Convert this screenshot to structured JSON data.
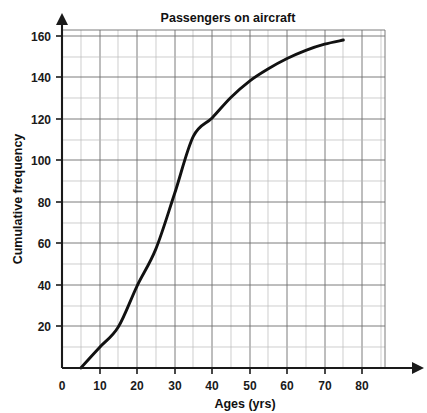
{
  "chart_data": {
    "type": "line",
    "title": "Passengers on aircraft",
    "xlabel": "Ages (yrs)",
    "ylabel": "Cumulative frequency",
    "xlim": [
      0,
      85
    ],
    "ylim": [
      0,
      170
    ],
    "grid": "on",
    "legend": "none",
    "x_ticks": [
      0,
      10,
      20,
      30,
      40,
      50,
      60,
      70,
      80
    ],
    "x_tick_labels": [
      "0",
      "10",
      "20",
      "30",
      "40",
      "50",
      "60",
      "70",
      "80"
    ],
    "x_minor_step": 5,
    "y_ticks": [
      0,
      20,
      40,
      60,
      80,
      100,
      120,
      140,
      160
    ],
    "y_tick_labels": [
      "0",
      "20",
      "40",
      "60",
      "80",
      "100",
      "120",
      "140",
      "160"
    ],
    "y_minor_step": 10,
    "series": [
      {
        "name": "Cumulative frequency of passenger ages",
        "x": [
          5,
          10,
          15,
          20,
          25,
          30,
          35,
          40,
          45,
          50,
          55,
          60,
          65,
          70,
          75
        ],
        "values": [
          0,
          10,
          20,
          40,
          58,
          85,
          113,
          122,
          132,
          140,
          146,
          151,
          155,
          158,
          160
        ]
      }
    ],
    "colors": {
      "curve": "#111111",
      "major_grid": "#6e6e6e",
      "minor_grid": "#b9b9b9",
      "axis": "#1a1a1a",
      "text": "#111111",
      "background": "#ffffff"
    }
  },
  "labels": {
    "title": "Passengers on aircraft",
    "xlabel": "Ages (yrs)",
    "ylabel": "Cumulative frequency",
    "x0": "0",
    "x10": "10",
    "x20": "20",
    "x30": "30",
    "x40": "40",
    "x50": "50",
    "x60": "60",
    "x70": "70",
    "x80": "80",
    "y20": "20",
    "y40": "40",
    "y60": "60",
    "y80": "80",
    "y100": "100",
    "y120": "120",
    "y140": "140",
    "y160": "160"
  }
}
